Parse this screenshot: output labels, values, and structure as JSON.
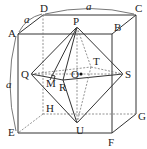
{
  "figure": {
    "type": "geometry-diagram"
  },
  "labels": {
    "A": "A",
    "B": "B",
    "C": "C",
    "D": "D",
    "E": "E",
    "F": "F",
    "G": "G",
    "H": "H",
    "P": "P",
    "Q": "Q",
    "R": "R",
    "S": "S",
    "T": "T",
    "U": "U",
    "O": "O",
    "M": "M"
  },
  "dimensions": {
    "top": "a",
    "left_top": "a",
    "left_side": "a"
  },
  "colors": {
    "line": "#333333",
    "hidden_line": "#777777",
    "background": "#ffffff"
  }
}
